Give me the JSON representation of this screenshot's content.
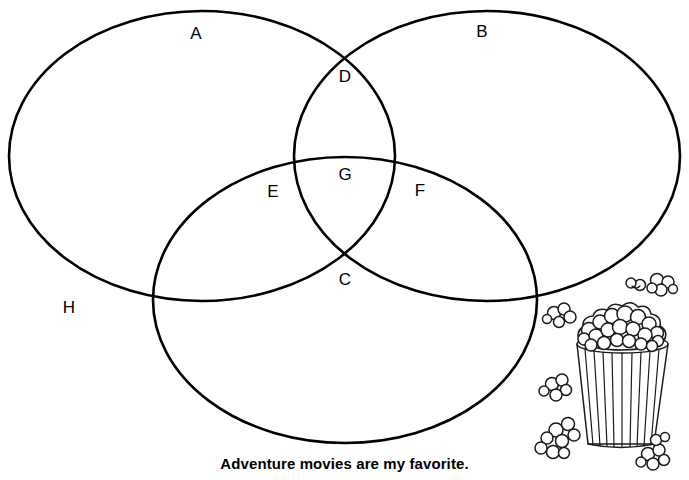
{
  "page": {
    "background_color": "#ffffff",
    "stroke_color": "#000000",
    "width": 689,
    "height": 480
  },
  "diagram": {
    "type": "venn-diagram",
    "set_count": 3,
    "circles": [
      {
        "id": "A",
        "name": "left-circle",
        "cx": 202,
        "cy": 156,
        "rx": 193,
        "ry": 145
      },
      {
        "id": "B",
        "name": "right-circle",
        "cx": 487,
        "cy": 156,
        "rx": 193,
        "ry": 145
      },
      {
        "id": "C",
        "name": "bottom-circle",
        "cx": 345,
        "cy": 300,
        "rx": 192,
        "ry": 143
      }
    ],
    "labels": [
      {
        "id": "A",
        "text": "A",
        "x": 196,
        "y": 33,
        "region": "left-circle-only"
      },
      {
        "id": "B",
        "text": "B",
        "x": 482,
        "y": 31,
        "region": "right-circle-only"
      },
      {
        "id": "D",
        "text": "D",
        "x": 345,
        "y": 76,
        "region": "left-and-right"
      },
      {
        "id": "G",
        "text": "G",
        "x": 345,
        "y": 174,
        "region": "all-three"
      },
      {
        "id": "E",
        "text": "E",
        "x": 273,
        "y": 191,
        "region": "left-and-bottom"
      },
      {
        "id": "F",
        "text": "F",
        "x": 420,
        "y": 190,
        "region": "right-and-bottom"
      },
      {
        "id": "C",
        "text": "C",
        "x": 345,
        "y": 279,
        "region": "bottom-circle-only"
      },
      {
        "id": "H",
        "text": "H",
        "x": 69,
        "y": 307,
        "region": "outside-all"
      }
    ]
  },
  "caption": {
    "text": "Adventure movies are my favorite."
  },
  "illustration": {
    "name": "popcorn-bucket",
    "description": "striped popcorn tub overflowing with popcorn kernels"
  }
}
